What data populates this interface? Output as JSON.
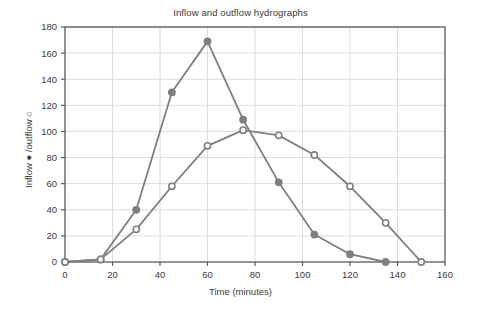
{
  "chart_data": {
    "type": "line",
    "title": "Inflow and outflow hydrographs",
    "xlabel": "Time (minutes)",
    "ylabel": "Inflow ● /outflow ○",
    "xlim": [
      0,
      160
    ],
    "ylim": [
      0,
      180
    ],
    "xticks": [
      0,
      20,
      40,
      60,
      80,
      100,
      120,
      140,
      160
    ],
    "yticks": [
      0,
      20,
      40,
      60,
      80,
      100,
      120,
      140,
      160,
      180
    ],
    "grid": true,
    "legend": "none",
    "line_color": "#7f7f7f",
    "grid_color": "#dcdcdc",
    "axis_color": "#595959",
    "background": "#ffffff",
    "x": [
      0,
      15,
      30,
      45,
      60,
      75,
      90,
      105,
      120,
      135,
      150
    ],
    "series": [
      {
        "name": "Inflow",
        "marker": "filled-circle",
        "marker_fill": "#7f7f7f",
        "values": [
          0,
          2,
          40,
          130,
          169,
          109,
          61,
          21,
          6,
          0,
          null
        ]
      },
      {
        "name": "Outflow",
        "marker": "open-circle",
        "marker_fill": "#ffffff",
        "values": [
          0,
          2,
          25,
          58,
          89,
          101,
          97,
          82,
          58,
          30,
          0
        ]
      }
    ]
  },
  "axis_tick_labels": {
    "x": [
      "0",
      "20",
      "40",
      "60",
      "80",
      "100",
      "120",
      "140",
      "160"
    ],
    "y": [
      "0",
      "20",
      "40",
      "60",
      "80",
      "100",
      "120",
      "140",
      "160",
      "180"
    ]
  }
}
